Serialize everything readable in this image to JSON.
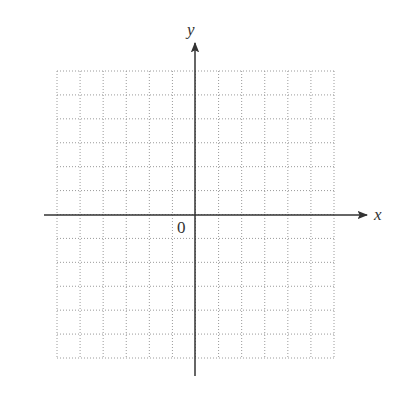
{
  "diagram": {
    "type": "coordinate-plane",
    "x_axis_label": "x",
    "y_axis_label": "y",
    "origin_label": "0",
    "grid": {
      "columns": 12,
      "rows": 12,
      "columns_left_of_origin": 6,
      "columns_right_of_origin": 6,
      "rows_above_origin": 6,
      "rows_below_origin": 6,
      "style": "dotted",
      "tick_labels": "none"
    },
    "colors": {
      "axis": "#333333",
      "grid": "#9a9a9a",
      "background": "#ffffff"
    }
  }
}
